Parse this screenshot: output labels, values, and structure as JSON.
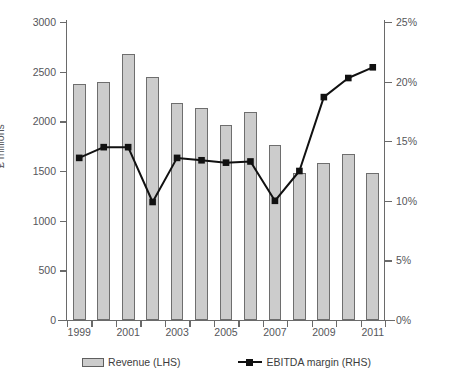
{
  "chart_data": {
    "type": "bar",
    "title": "",
    "subtitle": "",
    "xlabel": "",
    "ylabel": "£ millions",
    "y2label": "",
    "categories": [
      "1999",
      "2000",
      "2001",
      "2002",
      "2003",
      "2004",
      "2005",
      "2006",
      "2007",
      "2008",
      "2009",
      "2010",
      "2011"
    ],
    "x_tick_labels": [
      "1999",
      "",
      "2001",
      "",
      "2003",
      "",
      "2005",
      "",
      "2007",
      "",
      "2009",
      "",
      "2011"
    ],
    "ylim": [
      0,
      3000
    ],
    "y_ticks": [
      0,
      500,
      1000,
      1500,
      2000,
      2500,
      3000
    ],
    "y_tick_labels": [
      "0",
      "500",
      "1000",
      "1500",
      "2000",
      "2500",
      "3000"
    ],
    "y2lim": [
      0,
      25
    ],
    "y2_ticks": [
      0,
      5,
      10,
      15,
      20,
      25
    ],
    "y2_tick_labels": [
      "0%",
      "5%",
      "10%",
      "15%",
      "20%",
      "25%"
    ],
    "grid": false,
    "legend_position": "bottom",
    "series": [
      {
        "name": "Revenue (LHS)",
        "type": "bar",
        "axis": "left",
        "color": "#cccccc",
        "edge_color": "#6e6e6e",
        "values": [
          2380,
          2400,
          2680,
          2450,
          2180,
          2130,
          1960,
          2090,
          1765,
          1480,
          1585,
          1670,
          1475
        ]
      },
      {
        "name": "EBITDA margin (RHS)",
        "type": "line",
        "axis": "right",
        "color": "#111111",
        "marker": "square",
        "values": [
          13.6,
          14.5,
          14.5,
          9.9,
          13.6,
          13.4,
          13.2,
          13.3,
          10.0,
          12.5,
          18.7,
          20.3,
          21.2
        ]
      }
    ]
  },
  "legend": {
    "items": [
      {
        "label": "Revenue (LHS)",
        "icon": "bar-swatch"
      },
      {
        "label": "EBITDA margin (RHS)",
        "icon": "line-marker-swatch"
      }
    ]
  }
}
